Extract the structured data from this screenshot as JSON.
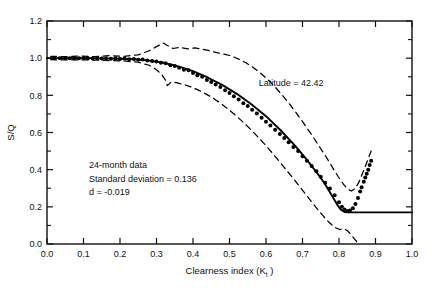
{
  "chart_data": {
    "type": "scatter",
    "title": "",
    "xlabel": "Clearness index  (K t )",
    "xlabel_main": "Clearness index",
    "xlabel_symbol": "(K",
    "xlabel_subscript": "t",
    "xlabel_symbol_end": ")",
    "ylabel": "S/Q",
    "xlim": [
      0.0,
      1.0
    ],
    "ylim": [
      0.0,
      1.2
    ],
    "xticks": [
      0.0,
      0.1,
      0.2,
      0.3,
      0.4,
      0.5,
      0.6,
      0.7,
      0.8,
      0.9,
      1.0
    ],
    "xtick_labels": [
      "0.0",
      "0.1",
      "0.2",
      "0.3",
      "0.4",
      "0.5",
      "0.6",
      "0.7",
      "0.8",
      "0.9",
      "1.0"
    ],
    "yticks": [
      0.0,
      0.2,
      0.4,
      0.6,
      0.8,
      1.0,
      1.2
    ],
    "ytick_labels": [
      "0.0",
      "0.2",
      "0.4",
      "0.6",
      "0.8",
      "1.0",
      "1.2"
    ],
    "y_minor_ticks": [
      0.1,
      0.3,
      0.5,
      0.7,
      0.9,
      1.1
    ],
    "grid": false,
    "legend": "none",
    "annotations": [
      {
        "name": "latitude",
        "text": "Latitude = 42.42",
        "x": 0.58,
        "y": 0.85
      },
      {
        "name": "data-span",
        "text": "24-month data",
        "x": 0.115,
        "y": 0.41
      },
      {
        "name": "standard-deviation",
        "text": "Standard deviation = 0.136",
        "x": 0.115,
        "y": 0.335
      },
      {
        "name": "d-value",
        "text": "d = -0.019",
        "x": 0.115,
        "y": 0.262
      }
    ],
    "series": [
      {
        "name": "measured-data-points",
        "style": "scatter",
        "marker": "filled-circle",
        "color": "#000000",
        "points": [
          [
            0.02,
            1.0
          ],
          [
            0.035,
            1.0
          ],
          [
            0.05,
            1.0
          ],
          [
            0.062,
            1.0
          ],
          [
            0.075,
            0.999
          ],
          [
            0.088,
            1.0
          ],
          [
            0.1,
            0.999
          ],
          [
            0.112,
            1.0
          ],
          [
            0.125,
            0.998
          ],
          [
            0.138,
            1.0
          ],
          [
            0.15,
            0.998
          ],
          [
            0.162,
            0.999
          ],
          [
            0.175,
            0.997
          ],
          [
            0.188,
            0.999
          ],
          [
            0.2,
            0.996
          ],
          [
            0.212,
            0.998
          ],
          [
            0.225,
            0.994
          ],
          [
            0.238,
            0.996
          ],
          [
            0.25,
            0.992
          ],
          [
            0.262,
            0.993
          ],
          [
            0.275,
            0.988
          ],
          [
            0.288,
            0.985
          ],
          [
            0.3,
            0.982
          ],
          [
            0.312,
            0.975
          ],
          [
            0.325,
            0.972
          ],
          [
            0.338,
            0.962
          ],
          [
            0.35,
            0.958
          ],
          [
            0.362,
            0.948
          ],
          [
            0.375,
            0.938
          ],
          [
            0.388,
            0.935
          ],
          [
            0.4,
            0.92
          ],
          [
            0.412,
            0.908
          ],
          [
            0.425,
            0.9
          ],
          [
            0.438,
            0.882
          ],
          [
            0.45,
            0.872
          ],
          [
            0.462,
            0.858
          ],
          [
            0.475,
            0.845
          ],
          [
            0.488,
            0.828
          ],
          [
            0.5,
            0.812
          ],
          [
            0.512,
            0.795
          ],
          [
            0.525,
            0.778
          ],
          [
            0.538,
            0.758
          ],
          [
            0.55,
            0.742
          ],
          [
            0.562,
            0.722
          ],
          [
            0.575,
            0.702
          ],
          [
            0.588,
            0.68
          ],
          [
            0.6,
            0.658
          ],
          [
            0.612,
            0.638
          ],
          [
            0.625,
            0.615
          ],
          [
            0.638,
            0.592
          ],
          [
            0.65,
            0.57
          ],
          [
            0.662,
            0.548
          ],
          [
            0.675,
            0.522
          ],
          [
            0.688,
            0.5
          ],
          [
            0.7,
            0.472
          ],
          [
            0.712,
            0.448
          ],
          [
            0.725,
            0.42
          ],
          [
            0.738,
            0.392
          ],
          [
            0.75,
            0.362
          ],
          [
            0.762,
            0.33
          ],
          [
            0.775,
            0.298
          ],
          [
            0.788,
            0.262
          ],
          [
            0.8,
            0.225
          ],
          [
            0.808,
            0.2
          ],
          [
            0.815,
            0.185
          ],
          [
            0.822,
            0.178
          ],
          [
            0.83,
            0.18
          ],
          [
            0.838,
            0.192
          ],
          [
            0.845,
            0.215
          ],
          [
            0.852,
            0.248
          ],
          [
            0.858,
            0.282
          ],
          [
            0.862,
            0.305
          ],
          [
            0.868,
            0.335
          ],
          [
            0.872,
            0.358
          ],
          [
            0.876,
            0.378
          ],
          [
            0.88,
            0.4
          ],
          [
            0.884,
            0.425
          ],
          [
            0.888,
            0.448
          ]
        ]
      },
      {
        "name": "fitted-curve",
        "style": "solid-line",
        "color": "#000000",
        "points": [
          [
            0.0,
            1.0
          ],
          [
            0.05,
            1.0
          ],
          [
            0.1,
            1.0
          ],
          [
            0.15,
            0.999
          ],
          [
            0.2,
            0.997
          ],
          [
            0.24,
            0.994
          ],
          [
            0.28,
            0.987
          ],
          [
            0.32,
            0.975
          ],
          [
            0.36,
            0.956
          ],
          [
            0.4,
            0.93
          ],
          [
            0.44,
            0.896
          ],
          [
            0.48,
            0.856
          ],
          [
            0.52,
            0.808
          ],
          [
            0.56,
            0.752
          ],
          [
            0.6,
            0.688
          ],
          [
            0.64,
            0.612
          ],
          [
            0.68,
            0.528
          ],
          [
            0.71,
            0.458
          ],
          [
            0.74,
            0.382
          ],
          [
            0.76,
            0.328
          ],
          [
            0.78,
            0.262
          ],
          [
            0.795,
            0.212
          ],
          [
            0.805,
            0.185
          ],
          [
            0.815,
            0.172
          ],
          [
            0.825,
            0.17
          ],
          [
            0.87,
            0.17
          ],
          [
            0.92,
            0.17
          ],
          [
            0.97,
            0.17
          ],
          [
            1.0,
            0.17
          ]
        ]
      },
      {
        "name": "upper-confidence-band",
        "style": "dashed-line",
        "color": "#000000",
        "points": [
          [
            0.01,
            1.01
          ],
          [
            0.05,
            1.008
          ],
          [
            0.09,
            1.012
          ],
          [
            0.13,
            1.008
          ],
          [
            0.17,
            1.014
          ],
          [
            0.21,
            1.01
          ],
          [
            0.25,
            1.018
          ],
          [
            0.28,
            1.04
          ],
          [
            0.3,
            1.062
          ],
          [
            0.318,
            1.082
          ],
          [
            0.33,
            1.068
          ],
          [
            0.345,
            1.052
          ],
          [
            0.365,
            1.058
          ],
          [
            0.385,
            1.05
          ],
          [
            0.405,
            1.055
          ],
          [
            0.425,
            1.048
          ],
          [
            0.445,
            1.04
          ],
          [
            0.465,
            1.03
          ],
          [
            0.485,
            1.022
          ],
          [
            0.505,
            1.012
          ],
          [
            0.525,
            0.995
          ],
          [
            0.545,
            0.975
          ],
          [
            0.565,
            0.95
          ],
          [
            0.585,
            0.92
          ],
          [
            0.605,
            0.885
          ],
          [
            0.625,
            0.845
          ],
          [
            0.645,
            0.8
          ],
          [
            0.665,
            0.752
          ],
          [
            0.685,
            0.7
          ],
          [
            0.705,
            0.645
          ],
          [
            0.725,
            0.588
          ],
          [
            0.745,
            0.528
          ],
          [
            0.765,
            0.468
          ],
          [
            0.782,
            0.412
          ],
          [
            0.798,
            0.362
          ],
          [
            0.812,
            0.322
          ],
          [
            0.824,
            0.295
          ],
          [
            0.834,
            0.285
          ],
          [
            0.844,
            0.298
          ],
          [
            0.854,
            0.33
          ],
          [
            0.862,
            0.368
          ],
          [
            0.87,
            0.408
          ],
          [
            0.878,
            0.448
          ],
          [
            0.886,
            0.49
          ],
          [
            0.892,
            0.522
          ]
        ]
      },
      {
        "name": "lower-confidence-band",
        "style": "dashed-line",
        "color": "#000000",
        "points": [
          [
            0.01,
            0.992
          ],
          [
            0.06,
            0.99
          ],
          [
            0.11,
            0.991
          ],
          [
            0.16,
            0.988
          ],
          [
            0.21,
            0.985
          ],
          [
            0.25,
            0.978
          ],
          [
            0.28,
            0.962
          ],
          [
            0.3,
            0.938
          ],
          [
            0.315,
            0.91
          ],
          [
            0.325,
            0.88
          ],
          [
            0.33,
            0.852
          ],
          [
            0.34,
            0.872
          ],
          [
            0.355,
            0.868
          ],
          [
            0.375,
            0.858
          ],
          [
            0.395,
            0.845
          ],
          [
            0.415,
            0.828
          ],
          [
            0.435,
            0.808
          ],
          [
            0.455,
            0.785
          ],
          [
            0.475,
            0.758
          ],
          [
            0.495,
            0.728
          ],
          [
            0.515,
            0.695
          ],
          [
            0.535,
            0.66
          ],
          [
            0.555,
            0.622
          ],
          [
            0.575,
            0.582
          ],
          [
            0.595,
            0.54
          ],
          [
            0.615,
            0.495
          ],
          [
            0.635,
            0.448
          ],
          [
            0.655,
            0.4
          ],
          [
            0.675,
            0.352
          ],
          [
            0.695,
            0.302
          ],
          [
            0.715,
            0.252
          ],
          [
            0.735,
            0.202
          ],
          [
            0.755,
            0.155
          ],
          [
            0.772,
            0.118
          ],
          [
            0.788,
            0.09
          ],
          [
            0.802,
            0.078
          ],
          [
            0.814,
            0.082
          ],
          [
            0.824,
            0.07
          ],
          [
            0.834,
            0.048
          ],
          [
            0.842,
            0.028
          ],
          [
            0.85,
            0.01
          ],
          [
            0.856,
            0.0
          ]
        ]
      }
    ]
  }
}
